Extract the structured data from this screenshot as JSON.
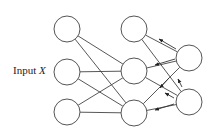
{
  "diagram": {
    "input_label": {
      "prefix": "Input",
      "variable": "X"
    },
    "colors": {
      "stroke": "#555555",
      "edge": "#444444",
      "background": "#ffffff"
    },
    "node_radius": 13,
    "layers": [
      {
        "name": "input",
        "nodes": [
          {
            "id": "L1",
            "cx": 67,
            "cy": 29
          },
          {
            "id": "L2",
            "cx": 67,
            "cy": 72
          },
          {
            "id": "L3",
            "cx": 67,
            "cy": 112
          }
        ]
      },
      {
        "name": "hidden",
        "nodes": [
          {
            "id": "M1",
            "cx": 134,
            "cy": 29
          },
          {
            "id": "M2",
            "cx": 134,
            "cy": 71
          },
          {
            "id": "M3",
            "cx": 134,
            "cy": 113
          }
        ]
      },
      {
        "name": "output",
        "nodes": [
          {
            "id": "R1",
            "cx": 189,
            "cy": 58
          },
          {
            "id": "R2",
            "cx": 189,
            "cy": 102
          }
        ]
      }
    ],
    "edges": [
      [
        "L1",
        "M2"
      ],
      [
        "L1",
        "M3"
      ],
      [
        "L2",
        "M2"
      ],
      [
        "L2",
        "M3"
      ],
      [
        "L3",
        "M2"
      ],
      [
        "L3",
        "M3"
      ],
      [
        "M1",
        "R1"
      ],
      [
        "M1",
        "R2"
      ],
      [
        "M2",
        "R1"
      ],
      [
        "M2",
        "R2"
      ],
      [
        "M3",
        "R1"
      ],
      [
        "M3",
        "R2"
      ]
    ],
    "backward_arrows": [
      {
        "from": [
          176,
          49
        ],
        "to": [
          159,
          39
        ]
      },
      {
        "from": [
          175,
          59
        ],
        "to": [
          155,
          65
        ]
      },
      {
        "from": [
          169,
          78
        ],
        "to": [
          160,
          88
        ]
      },
      {
        "from": [
          182,
          87
        ],
        "to": [
          178,
          79
        ]
      },
      {
        "from": [
          174,
          98
        ],
        "to": [
          165,
          93
        ]
      },
      {
        "from": [
          174,
          104
        ],
        "to": [
          155,
          110
        ]
      }
    ]
  }
}
